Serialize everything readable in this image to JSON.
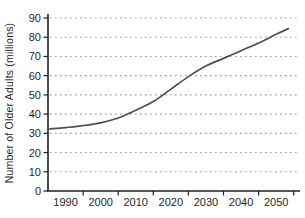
{
  "figure": {
    "background": "#ffffff"
  },
  "chart_data": {
    "type": "line",
    "title": "",
    "xlabel": "",
    "ylabel": "Number of Older Adults (millions)",
    "x_tick_labels": [
      "1990",
      "2000",
      "2010",
      "2020",
      "2030",
      "2040",
      "2050"
    ],
    "y_tick_labels": [
      "0",
      "10",
      "20",
      "30",
      "40",
      "50",
      "60",
      "70",
      "80",
      "90"
    ],
    "y_tick_values": [
      0,
      10,
      20,
      30,
      40,
      50,
      60,
      70,
      80,
      90
    ],
    "ylim": [
      0,
      90
    ],
    "grid": "horizontal dotted",
    "legend": "none",
    "series": [
      {
        "name": "number-of-older-adults",
        "points": [
          {
            "year": 1985.5,
            "value": 32.3
          },
          {
            "year": 1990,
            "value": 33
          },
          {
            "year": 1995,
            "value": 34
          },
          {
            "year": 2000,
            "value": 35.5
          },
          {
            "year": 2005,
            "value": 38
          },
          {
            "year": 2010,
            "value": 42
          },
          {
            "year": 2015,
            "value": 46.5
          },
          {
            "year": 2020,
            "value": 53
          },
          {
            "year": 2025,
            "value": 59.5
          },
          {
            "year": 2030,
            "value": 65
          },
          {
            "year": 2035,
            "value": 69
          },
          {
            "year": 2040,
            "value": 73
          },
          {
            "year": 2045,
            "value": 77
          },
          {
            "year": 2050,
            "value": 81.5
          },
          {
            "year": 2053.5,
            "value": 84.5
          }
        ]
      }
    ],
    "colors": {
      "line": "#4f4f4f",
      "axis": "#1f1f1f",
      "grid": "#9a9a9a",
      "text": "#1f1f1f"
    }
  }
}
